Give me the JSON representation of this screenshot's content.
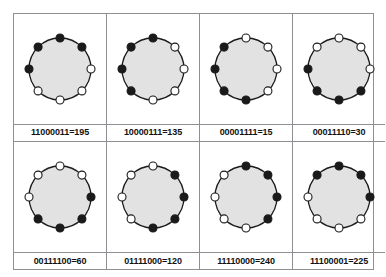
{
  "figure": {
    "type": "binary-code-wheel-grid",
    "rows": 2,
    "columns": 4,
    "bit_count": 8,
    "reading_order": "clockwise from top",
    "colors": {
      "circle_fill": "#e2e2e2",
      "circle_stroke": "#1a1a1a",
      "bit_one_fill": "#1a1a1a",
      "bit_zero_fill": "#ffffff",
      "dot_stroke": "#1a1a1a",
      "border": "#8d8f92",
      "label_text": "#111111",
      "background": "#ffffff"
    }
  },
  "cells": [
    {
      "id": "cell-1",
      "binary": "11000011",
      "decimal": "195",
      "label": "11000011=195",
      "bits": [
        1,
        1,
        0,
        0,
        0,
        0,
        1,
        1
      ]
    },
    {
      "id": "cell-2",
      "binary": "10000111",
      "decimal": "135",
      "label": "10000111=135",
      "bits": [
        1,
        0,
        0,
        0,
        0,
        1,
        1,
        1
      ]
    },
    {
      "id": "cell-3",
      "binary": "00001111",
      "decimal": "15",
      "label": "00001111=15",
      "bits": [
        0,
        0,
        0,
        0,
        1,
        1,
        1,
        1
      ]
    },
    {
      "id": "cell-4",
      "binary": "00011110",
      "decimal": "30",
      "label": "00011110=30",
      "bits": [
        0,
        0,
        0,
        1,
        1,
        1,
        1,
        0
      ]
    },
    {
      "id": "cell-5",
      "binary": "00111100",
      "decimal": "60",
      "label": "00111100=60",
      "bits": [
        0,
        0,
        1,
        1,
        1,
        1,
        0,
        0
      ]
    },
    {
      "id": "cell-6",
      "binary": "01111000",
      "decimal": "120",
      "label": "01111000=120",
      "bits": [
        0,
        1,
        1,
        1,
        1,
        0,
        0,
        0
      ]
    },
    {
      "id": "cell-7",
      "binary": "11110000",
      "decimal": "240",
      "label": "11110000=240",
      "bits": [
        1,
        1,
        1,
        1,
        0,
        0,
        0,
        0
      ]
    },
    {
      "id": "cell-8",
      "binary": "11100001",
      "decimal": "225",
      "label": "11100001=225",
      "bits": [
        1,
        1,
        1,
        0,
        0,
        0,
        0,
        1
      ]
    }
  ]
}
